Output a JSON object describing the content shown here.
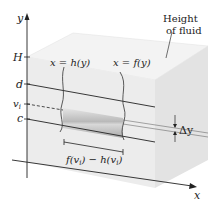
{
  "diagram": {
    "axis_labels": {
      "y": "y",
      "x": "x"
    },
    "y_ticks": [
      "H",
      "d",
      "v_i",
      "c"
    ],
    "curve_labels": {
      "left": "x = h(y)",
      "right": "x = f(y)"
    },
    "annotation_height": [
      "Height",
      "of fluid"
    ],
    "strip_label": "f(v_i) − h(v_i)",
    "delta_label": "Δy",
    "colors": {
      "box_face": "#ececec",
      "box_top": "#f3f3f3",
      "box_side": "#e2e2e2",
      "strip_dark": "#a8a8a8",
      "strip_light": "#d4d4d4",
      "line": "#222222"
    }
  }
}
